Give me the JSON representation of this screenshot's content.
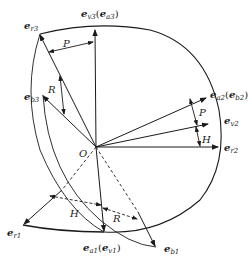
{
  "diagram": {
    "origin_label": "O",
    "vectors": {
      "er3": {
        "base": "e",
        "sub": "r3"
      },
      "ev3": {
        "base": "e",
        "sub": "v3",
        "paren_base": "e",
        "paren_sub": "a3"
      },
      "eb3": {
        "base": "e",
        "sub": "b3"
      },
      "ea2": {
        "base": "e",
        "sub": "a2",
        "paren_base": "e",
        "paren_sub": "b2"
      },
      "ev2": {
        "base": "e",
        "sub": "v2"
      },
      "er2": {
        "base": "e",
        "sub": "r2"
      },
      "er1": {
        "base": "e",
        "sub": "r1"
      },
      "ea1": {
        "base": "e",
        "sub": "a1",
        "paren_base": "e",
        "paren_sub": "v1"
      },
      "eb1": {
        "base": "e",
        "sub": "b1"
      }
    },
    "angles": {
      "P_top": "P",
      "R_top": "R",
      "P_right": "P",
      "H_right": "H",
      "H_bottom": "H",
      "R_bottom": "R"
    },
    "colors": {
      "stroke": "#1a1a1a",
      "background": "#ffffff"
    }
  }
}
